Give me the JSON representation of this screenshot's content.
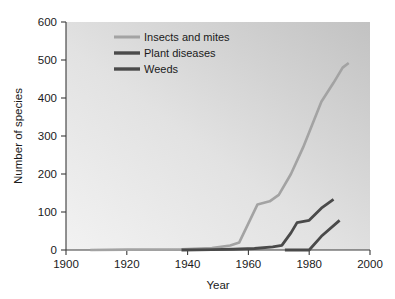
{
  "chart_data": {
    "type": "line",
    "title": "",
    "xlabel": "Year",
    "ylabel": "Number of species",
    "xlim": [
      1900,
      2000
    ],
    "ylim": [
      0,
      600
    ],
    "grid": false,
    "legend_position": "upper-left-inside",
    "x_ticks": [
      1900,
      1920,
      1940,
      1960,
      1980,
      2000
    ],
    "x_tick_labels": [
      "1900",
      "1920",
      "1940",
      "1960",
      "1980",
      "2000"
    ],
    "y_ticks": [
      0,
      100,
      200,
      300,
      400,
      500,
      600
    ],
    "y_tick_labels": [
      "0",
      "100",
      "200",
      "300",
      "400",
      "500",
      "600"
    ],
    "series": [
      {
        "name": "Insects and mites",
        "color": "#a3a3a3",
        "width": 2.6,
        "x": [
          1908,
          1920,
          1938,
          1948,
          1954,
          1957,
          1960,
          1963,
          1967,
          1970,
          1974,
          1978,
          1980,
          1984,
          1988,
          1991,
          1993
        ],
        "values": [
          0,
          1,
          2,
          5,
          12,
          20,
          70,
          120,
          128,
          145,
          200,
          270,
          310,
          390,
          440,
          480,
          492
        ]
      },
      {
        "name": "Plant diseases",
        "color": "#4a4a4a",
        "width": 2.8,
        "x": [
          1938,
          1948,
          1955,
          1962,
          1968,
          1971,
          1974,
          1976,
          1980,
          1984,
          1988
        ],
        "values": [
          0,
          1,
          2,
          4,
          8,
          12,
          45,
          72,
          78,
          110,
          133
        ]
      },
      {
        "name": "Weeds",
        "color": "#4a4a4a",
        "width": 2.8,
        "x": [
          1972,
          1980,
          1984,
          1990
        ],
        "values": [
          0,
          0,
          36,
          78
        ]
      }
    ],
    "legend_entries": [
      {
        "label": "Insects and mites",
        "color": "#a3a3a3"
      },
      {
        "label": "Plant diseases",
        "color": "#4a4a4a"
      },
      {
        "label": "Weeds",
        "color": "#4a4a4a"
      }
    ]
  }
}
